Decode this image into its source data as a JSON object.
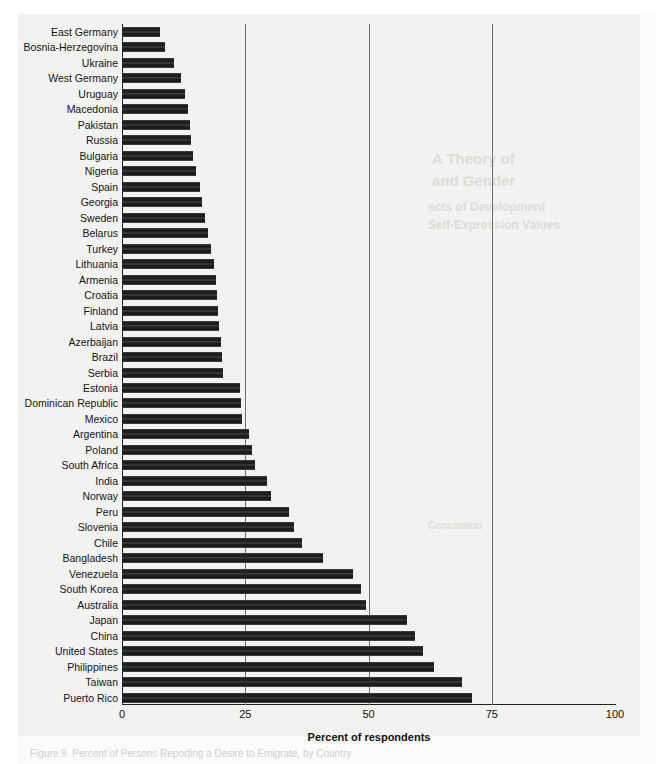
{
  "chart_data": {
    "type": "bar",
    "orientation": "horizontal",
    "title": "",
    "xlabel": "Percent of respondents",
    "ylabel": "",
    "xlim": [
      0,
      100
    ],
    "xticks": [
      0,
      25,
      50,
      75,
      100
    ],
    "xtick_labels": [
      "0",
      "25",
      "50",
      "75",
      "100"
    ],
    "grid": "vertical gridlines at 25, 50, 75",
    "legend": "none",
    "bar_color": "#2b2b2b",
    "categories": [
      "East Germany",
      "Bosnia-Herzegovina",
      "Ukraine",
      "West Germany",
      "Uruguay",
      "Macedonia",
      "Pakistan",
      "Russia",
      "Bulgaria",
      "Nigeria",
      "Spain",
      "Georgia",
      "Sweden",
      "Belarus",
      "Turkey",
      "Lithuania",
      "Armenia",
      "Croatia",
      "Finland",
      "Latvia",
      "Azerbaijan",
      "Brazil",
      "Serbia",
      "Estonia",
      "Dominican Republic",
      "Mexico",
      "Argentina",
      "Poland",
      "South Africa",
      "India",
      "Norway",
      "Peru",
      "Slovenia",
      "Chile",
      "Bangladesh",
      "Venezuela",
      "South Korea",
      "Australia",
      "Japan",
      "China",
      "United States",
      "Philippines",
      "Taiwan",
      "Puerto Rico"
    ],
    "values": [
      7.7,
      8.8,
      10.6,
      12.0,
      12.8,
      13.3,
      13.8,
      14.0,
      14.5,
      15.0,
      15.8,
      16.3,
      16.8,
      17.5,
      18.0,
      18.6,
      19.0,
      19.2,
      19.4,
      19.6,
      20.0,
      20.2,
      20.5,
      24.0,
      24.2,
      24.3,
      25.8,
      26.4,
      27.0,
      29.5,
      30.3,
      33.8,
      34.8,
      36.5,
      40.8,
      46.8,
      48.4,
      49.4,
      57.8,
      59.5,
      61.0,
      63.2,
      69.0,
      71.0
    ]
  },
  "axis": {
    "x_title": "Percent of respondents"
  },
  "ghost_text": {
    "caption": "Figure 9. Percent of Persons Reporting a Desire to Emigrate, by Country",
    "head_1": "A Theory of",
    "head_2": "and Gender",
    "head_3": "ects of Development",
    "head_4": "Self-Expression Values",
    "head_5": "Conclusion"
  }
}
